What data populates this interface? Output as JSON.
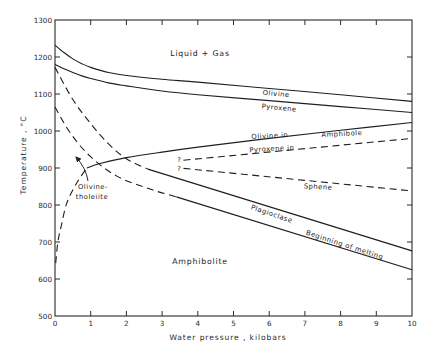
{
  "chart_data": {
    "type": "line",
    "title": "",
    "xlabel": "Water pressure , kilobars",
    "ylabel": "Temperature , °C",
    "xlim": [
      0,
      10
    ],
    "ylim": [
      500,
      1300
    ],
    "xticks": [
      0,
      1,
      2,
      3,
      4,
      5,
      6,
      7,
      8,
      9,
      10
    ],
    "yticks": [
      500,
      600,
      700,
      800,
      900,
      1000,
      1100,
      1200,
      1300
    ],
    "grid": false,
    "legend": null,
    "series": [
      {
        "name": "Olivine (liquidus)",
        "style": "solid",
        "x": [
          0,
          0.25,
          0.5,
          0.75,
          1,
          1.5,
          2,
          3,
          4,
          6,
          8,
          10
        ],
        "y": [
          1232,
          1212,
          1195,
          1182,
          1172,
          1158,
          1150,
          1140,
          1132,
          1115,
          1098,
          1080
        ]
      },
      {
        "name": "Pyroxene",
        "style": "solid",
        "x": [
          0,
          0.25,
          0.5,
          0.75,
          1,
          1.5,
          2,
          3,
          4,
          6,
          8,
          10
        ],
        "y": [
          1180,
          1168,
          1158,
          1149,
          1142,
          1130,
          1122,
          1108,
          1098,
          1082,
          1066,
          1050
        ]
      },
      {
        "name": "Plagioclase (inferred)",
        "style": "dashed",
        "x": [
          0,
          0.5,
          1,
          1.5,
          2,
          2.6
        ],
        "y": [
          1172,
          1085,
          1020,
          965,
          925,
          897
        ]
      },
      {
        "name": "Plagioclase",
        "style": "solid",
        "x": [
          2.6,
          10
        ],
        "y": [
          897,
          676
        ]
      },
      {
        "name": "Beginning of melting (inferred)",
        "style": "dashed",
        "x": [
          0,
          0.42,
          0.98,
          1.73,
          2.66,
          3.4
        ],
        "y": [
          1065,
          996,
          932,
          878,
          843,
          822
        ]
      },
      {
        "name": "Beginning of melting",
        "style": "solid",
        "x": [
          3.4,
          10
        ],
        "y": [
          822,
          625
        ]
      },
      {
        "name": "Olivine-tholeiite",
        "style": "dashed",
        "x": [
          0.02,
          0.08,
          0.18,
          0.33,
          0.6,
          0.89
        ],
        "y": [
          643,
          700,
          745,
          805,
          858,
          900
        ]
      },
      {
        "name": "Olivine in Amphibole",
        "style": "solid",
        "x": [
          0.89,
          1.26,
          2,
          3,
          4.06,
          6,
          8,
          10
        ],
        "y": [
          900,
          912,
          928,
          943,
          957,
          980,
          1002,
          1023
        ]
      },
      {
        "name": "Pyroxene in Amphibole",
        "style": "dashed",
        "x": [
          3.6,
          10
        ],
        "y": [
          921,
          980
        ]
      },
      {
        "name": "Sphene",
        "style": "dashed",
        "x": [
          3.6,
          10
        ],
        "y": [
          899,
          838
        ]
      }
    ],
    "annotations": {
      "liquid_gas": "Liquid + Gas",
      "olivine": "Olivine",
      "pyroxene": "Pyroxene",
      "olivine_in": "Olivine in",
      "amphibole": "Amphibole",
      "pyroxene_in": "Pyroxene in",
      "sphene": "Sphene",
      "plagioclase": "Plagioclase",
      "beginning_of_melting": "Beginning of melting",
      "amphibolite": "Amphibolite",
      "olivine_tholeiite_line1": "Olivine-",
      "olivine_tholeiite_line2": "tholeiite",
      "question_mark": "?"
    }
  }
}
